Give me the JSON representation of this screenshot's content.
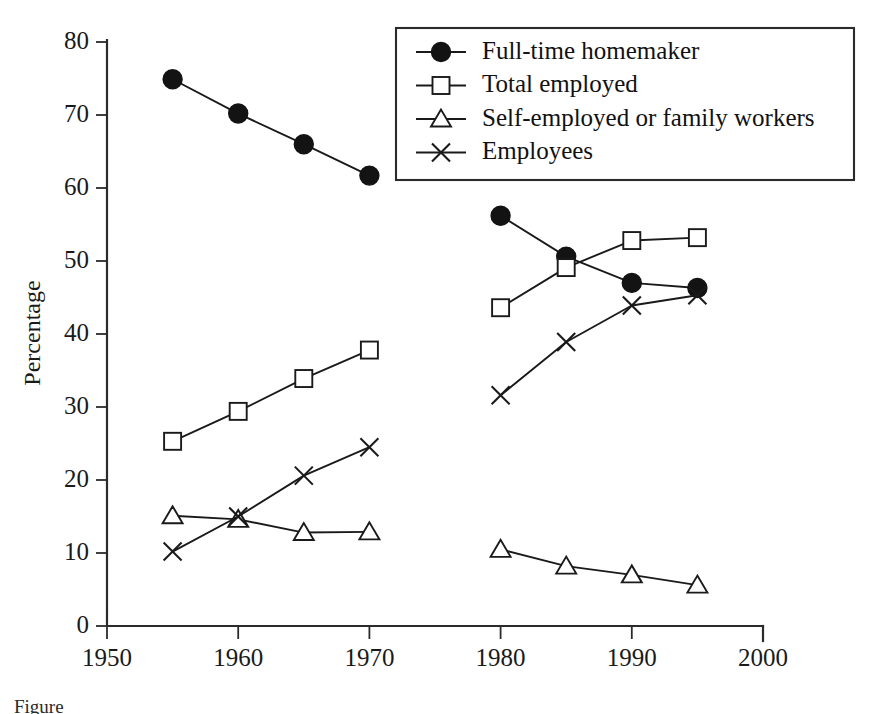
{
  "chart_data": {
    "type": "line",
    "title": "",
    "subtitle": "",
    "xlabel": "",
    "ylabel": "Percentage",
    "xlim": [
      1950,
      2000
    ],
    "ylim": [
      0,
      80
    ],
    "xticks": [
      1950,
      1960,
      1970,
      1980,
      1990,
      2000
    ],
    "yticks": [
      0,
      10,
      20,
      30,
      40,
      50,
      60,
      70,
      80
    ],
    "grid": false,
    "legend_position": "top-right",
    "series": [
      {
        "name": "Full-time homemaker",
        "marker": "filled-circle",
        "segments": [
          {
            "x": [
              1955,
              1960,
              1965,
              1970
            ],
            "values": [
              74.9,
              70.2,
              66.0,
              61.7
            ]
          },
          {
            "x": [
              1980,
              1985,
              1990,
              1995
            ],
            "values": [
              56.2,
              50.6,
              47.0,
              46.3
            ]
          }
        ]
      },
      {
        "name": "Total employed",
        "marker": "open-square",
        "segments": [
          {
            "x": [
              1955,
              1960,
              1965,
              1970
            ],
            "values": [
              25.3,
              29.4,
              33.9,
              37.8
            ]
          },
          {
            "x": [
              1980,
              1985,
              1990,
              1995
            ],
            "values": [
              43.6,
              49.1,
              52.8,
              53.2
            ]
          }
        ]
      },
      {
        "name": "Self-employed or family workers",
        "marker": "open-triangle",
        "segments": [
          {
            "x": [
              1955,
              1960,
              1965,
              1970
            ],
            "values": [
              15.1,
              14.6,
              12.8,
              12.9
            ]
          },
          {
            "x": [
              1980,
              1985,
              1990,
              1995
            ],
            "values": [
              10.5,
              8.2,
              7.0,
              5.6
            ]
          }
        ]
      },
      {
        "name": "Employees",
        "marker": "cross",
        "segments": [
          {
            "x": [
              1955,
              1960,
              1965,
              1970
            ],
            "values": [
              10.2,
              15.0,
              20.6,
              24.5
            ]
          },
          {
            "x": [
              1980,
              1985,
              1990,
              1995
            ],
            "values": [
              31.6,
              38.9,
              43.9,
              45.3
            ]
          }
        ]
      }
    ]
  },
  "axes": {
    "ylabel": "Percentage",
    "ytick_labels": [
      "0",
      "10",
      "20",
      "30",
      "40",
      "50",
      "60",
      "70",
      "80"
    ],
    "xtick_labels": [
      "1950",
      "1960",
      "1970",
      "1980",
      "1990",
      "2000"
    ]
  },
  "legend": {
    "items": [
      {
        "label": "Full-time homemaker",
        "marker": "filled-circle"
      },
      {
        "label": "Total employed",
        "marker": "open-square"
      },
      {
        "label": "Self-employed or family workers",
        "marker": "open-triangle"
      },
      {
        "label": "Employees",
        "marker": "cross"
      }
    ]
  },
  "caption": {
    "text": "Figure"
  },
  "colors": {
    "ink": "#1a1a1a",
    "background": "#ffffff"
  }
}
